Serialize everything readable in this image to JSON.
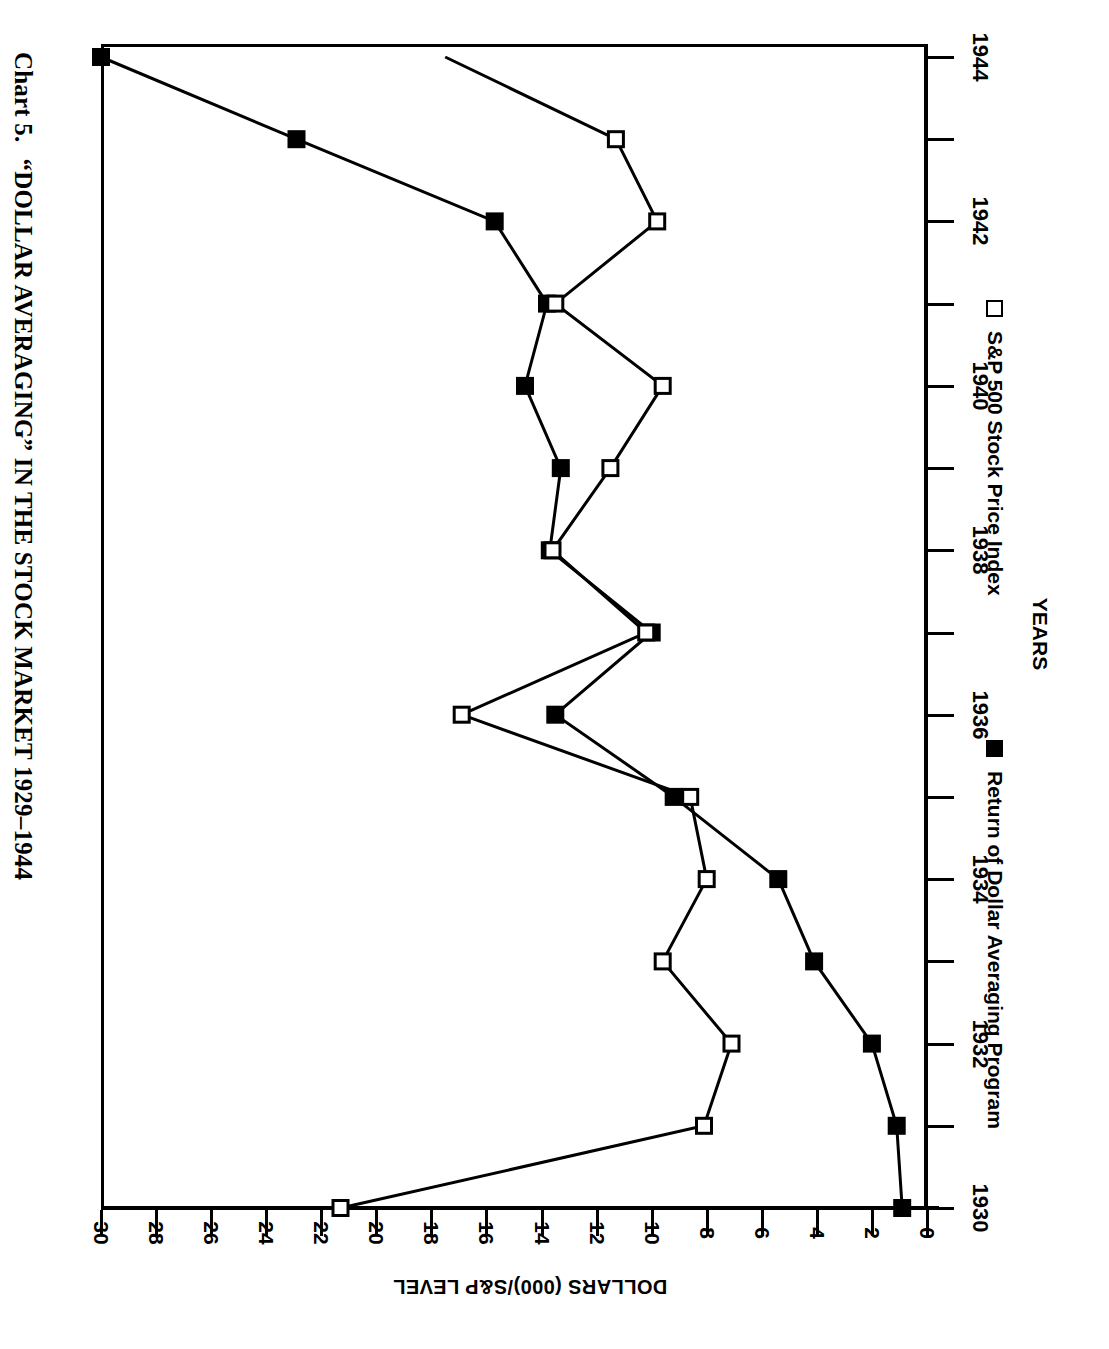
{
  "title": {
    "number": "Chart 5.",
    "text": "“DOLLAR AVERAGING” IN THE STOCK MARKET 1929–1944"
  },
  "axes": {
    "value_axis_title": "DOLLARS (000)/S&P LEVEL",
    "year_axis_title": "YEARS"
  },
  "legend": [
    {
      "marker": "filled-square-marker",
      "label": "Return of Dollar Averaging Program"
    },
    {
      "marker": "open-square-marker",
      "label": "S&P 500 Stock Price Index"
    }
  ],
  "chart_data": {
    "type": "line",
    "title": "Chart 5. “DOLLAR AVERAGING” IN THE STOCK MARKET 1929–1944",
    "xlabel": "YEARS",
    "ylabel": "DOLLARS (000)/S&P LEVEL",
    "orientation": "rotated-90",
    "grid": false,
    "legend_position": "right",
    "xlim": [
      1930,
      1944
    ],
    "ylim": [
      0,
      30
    ],
    "x_ticks": [
      1930,
      1931,
      1932,
      1933,
      1934,
      1935,
      1936,
      1937,
      1938,
      1939,
      1940,
      1941,
      1942,
      1943,
      1944
    ],
    "x_tick_labels": [
      "1930",
      "",
      "1932",
      "",
      "1934",
      "",
      "1936",
      "",
      "1938",
      "",
      "1940",
      "",
      "1942",
      "",
      "1944"
    ],
    "y_ticks": [
      0,
      2,
      4,
      6,
      8,
      10,
      12,
      14,
      16,
      18,
      20,
      22,
      24,
      26,
      28,
      30
    ],
    "y_tick_labels": [
      "0",
      "2",
      "4",
      "6",
      "8",
      "10",
      "12",
      "14",
      "16",
      "18",
      "20",
      "22",
      "24",
      "26",
      "28",
      "30"
    ],
    "x": [
      1930,
      1931,
      1932,
      1933,
      1934,
      1935,
      1936,
      1937,
      1938,
      1939,
      1940,
      1941,
      1942,
      1943,
      1944
    ],
    "series": [
      {
        "name": "Return of Dollar Averaging Program",
        "marker": "filled-square",
        "values": [
          0.9,
          1.1,
          2.0,
          4.1,
          5.4,
          9.2,
          13.5,
          10.0,
          13.7,
          13.3,
          14.6,
          13.8,
          15.7,
          22.9,
          30.0
        ]
      },
      {
        "name": "S&P 500 Stock Price Index",
        "marker": "open-square",
        "values": [
          21.3,
          8.1,
          7.1,
          9.6,
          8.0,
          8.6,
          16.9,
          10.2,
          13.6,
          11.5,
          9.6,
          13.5,
          9.8,
          11.3,
          17.5
        ]
      }
    ]
  }
}
